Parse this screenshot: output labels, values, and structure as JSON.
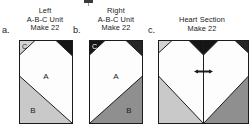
{
  "page": {
    "background": "#ffffff"
  },
  "crop_mark": {
    "name": "registration-mark",
    "color": "#3a3a3a"
  },
  "palette": {
    "outline": "#1b1b1b",
    "background_white": "#ffffff",
    "fabric_a_white": "#fdfdfd",
    "fabric_b_light_gray": "#c9c9c9",
    "fabric_b_dark_gray": "#8f8f8f",
    "fabric_c_light_gray": "#d2d2d2",
    "fabric_c_black": "#151515",
    "text": "#1b1b1b"
  },
  "steps": [
    {
      "key": "a",
      "step_letter": "a.",
      "caption_line1": "Left",
      "caption_line2": "A-B-C Unit",
      "caption_line3": "Make 22",
      "labels": {
        "a": "A",
        "b": "B",
        "c": "C"
      },
      "patch_a_fill": "#fdfdfd",
      "patch_b_fill": "#c9c9c9",
      "patch_c_fill": "#d2d2d2",
      "patch_c_text_color": "#1b1b1b",
      "corner_black_fill": "#151515",
      "orientation": "left"
    },
    {
      "key": "b",
      "step_letter": "b.",
      "caption_line1": "Right",
      "caption_line2": "A-B-C Unit",
      "caption_line3": "Make 22",
      "labels": {
        "a": "A",
        "b": "B",
        "c": "C"
      },
      "patch_a_fill": "#fdfdfd",
      "patch_b_fill": "#8f8f8f",
      "patch_c_fill": "#151515",
      "patch_c_text_color": "#ffffff",
      "corner_black_fill": "#262626",
      "orientation": "right"
    },
    {
      "key": "c",
      "step_letter": "c.",
      "caption_line1": "",
      "caption_line2": "Heart Section",
      "caption_line3": "Make 22",
      "labels": {
        "a": "",
        "b": "",
        "c": ""
      },
      "orientation": "heart",
      "seam_marker": "center-seam-arrows"
    }
  ]
}
